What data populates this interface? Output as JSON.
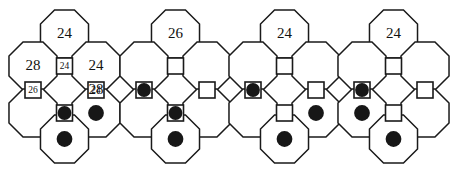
{
  "image": {
    "title": "Truncated square tiling configurations",
    "width": 453,
    "height": 170,
    "background_color": "#ffffff",
    "line_color": "#1a1a1a",
    "token_color": "#171717",
    "text_color": "#111111"
  },
  "geometry": {
    "description": "Each panel shows a cluster of the truncated square tiling: four large octagons (top, left, right, bottom) plus small squares at the shared vertices.",
    "octagon_radius": 26,
    "square_half": 8,
    "dot_radius": 7.5,
    "panel_width": 113,
    "cells": {
      "octagons": [
        {
          "id": "oct-top",
          "cx": 56.5,
          "cy": 34
        },
        {
          "id": "oct-left",
          "cx": 25,
          "cy": 66
        },
        {
          "id": "oct-right",
          "cx": 88,
          "cy": 66
        },
        {
          "id": "oct-left-lower",
          "cx": 25,
          "cy": 113
        },
        {
          "id": "oct-right-lower",
          "cx": 88,
          "cy": 113
        },
        {
          "id": "oct-bottom",
          "cx": 56.5,
          "cy": 139
        }
      ],
      "squares": [
        {
          "id": "sq-upper-center",
          "cx": 56.5,
          "cy": 66
        },
        {
          "id": "sq-mid-left",
          "cx": 25,
          "cy": 90
        },
        {
          "id": "sq-mid-right",
          "cx": 88,
          "cy": 90
        },
        {
          "id": "sq-lower-center",
          "cx": 56.5,
          "cy": 113
        }
      ]
    }
  },
  "figures": [
    {
      "index": 1,
      "name": "figure-1-labeled",
      "x_offset": 8,
      "labels": [
        {
          "cell": "oct-top",
          "value": "24",
          "kind": "octagon"
        },
        {
          "cell": "oct-left",
          "value": "28",
          "kind": "octagon"
        },
        {
          "cell": "oct-right",
          "value": "24",
          "kind": "octagon"
        },
        {
          "cell": "sq-upper-center",
          "value": "24",
          "kind": "square"
        },
        {
          "cell": "sq-mid-left",
          "value": "26",
          "kind": "square"
        },
        {
          "cell": "sq-mid-right",
          "value": "24",
          "kind": "square"
        },
        {
          "cell": "oct-right-lower",
          "value": "28",
          "kind": "octagon-upper-area"
        }
      ],
      "tokens": [
        {
          "cell": "sq-lower-center"
        },
        {
          "cell": "oct-right-lower"
        },
        {
          "cell": "oct-bottom"
        }
      ]
    },
    {
      "index": 2,
      "name": "figure-2",
      "x_offset": 119,
      "top_label": "26",
      "labels": [
        {
          "cell": "oct-top",
          "value": "26",
          "kind": "octagon"
        }
      ],
      "tokens": [
        {
          "cell": "sq-mid-left"
        },
        {
          "cell": "sq-lower-center"
        },
        {
          "cell": "oct-bottom"
        }
      ]
    },
    {
      "index": 3,
      "name": "figure-3",
      "x_offset": 228,
      "top_label": "24",
      "labels": [
        {
          "cell": "oct-top",
          "value": "24",
          "kind": "octagon"
        }
      ],
      "tokens": [
        {
          "cell": "sq-mid-left"
        },
        {
          "cell": "oct-right-lower"
        },
        {
          "cell": "oct-bottom"
        }
      ]
    },
    {
      "index": 4,
      "name": "figure-4",
      "x_offset": 337,
      "top_label": "24",
      "labels": [
        {
          "cell": "oct-top",
          "value": "24",
          "kind": "octagon"
        }
      ],
      "tokens": [
        {
          "cell": "sq-mid-left"
        },
        {
          "cell": "oct-left-lower"
        },
        {
          "cell": "oct-bottom"
        }
      ]
    }
  ],
  "text_values": {
    "fig1_oct_top": "24",
    "fig1_oct_left": "28",
    "fig1_oct_right": "24",
    "fig1_sq_upper_center": "24",
    "fig1_sq_mid_left": "26",
    "fig1_sq_mid_right": "24",
    "fig1_center_28": "28",
    "fig2_oct_top": "26",
    "fig3_oct_top": "24",
    "fig4_oct_top": "24"
  }
}
